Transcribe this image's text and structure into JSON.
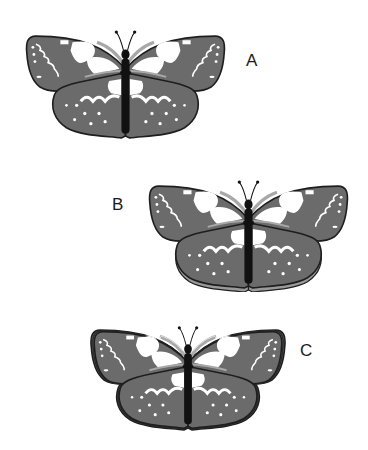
{
  "figure": {
    "butterflies": [
      {
        "label": "A",
        "variant": "plain-edge"
      },
      {
        "label": "B",
        "variant": "shadow-band-edge"
      },
      {
        "label": "C",
        "variant": "double-outline-edge"
      }
    ]
  },
  "colors": {
    "wing": "#6b6b6b",
    "outline": "#1e1e1e",
    "patch": "#ffffff",
    "vein": "#a8a8a8",
    "body": "#111111",
    "band": "#9a9a9a"
  }
}
